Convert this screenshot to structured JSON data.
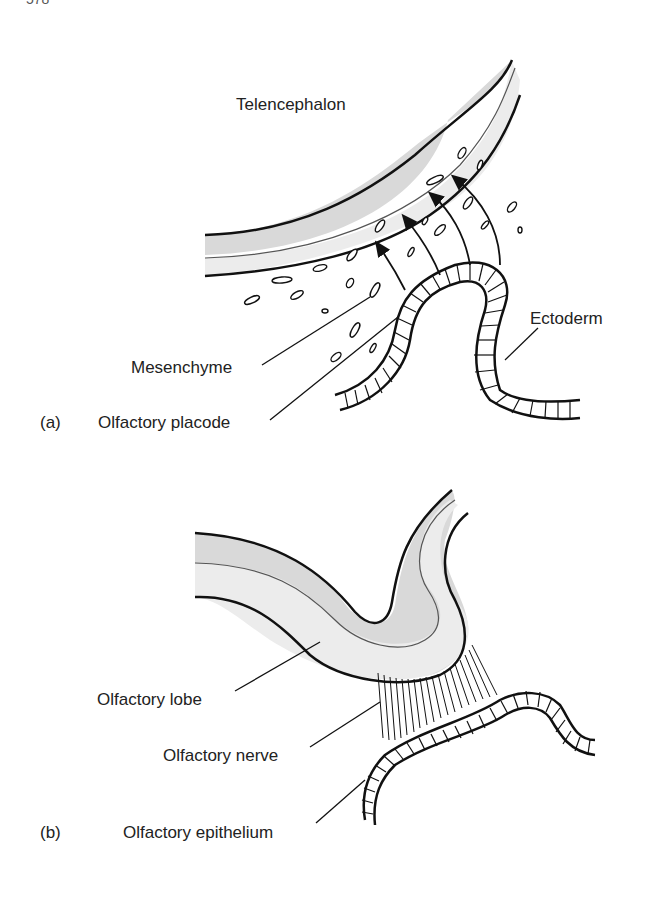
{
  "page_number_fragment": "578",
  "panel_a": {
    "letter": "(a)",
    "labels": {
      "telencephalon": "Telencephalon",
      "mesenchyme": "Mesenchyme",
      "olfactory_placode": "Olfactory placode",
      "ectoderm": "Ectoderm"
    }
  },
  "panel_b": {
    "letter": "(b)",
    "labels": {
      "olfactory_lobe": "Olfactory lobe",
      "olfactory_nerve": "Olfactory nerve",
      "olfactory_epithelium": "Olfactory epithelium"
    }
  },
  "colors": {
    "outline": "#111111",
    "tissue_dark": "#d9d9d9",
    "tissue_light": "#ececec",
    "text": "#222222"
  }
}
